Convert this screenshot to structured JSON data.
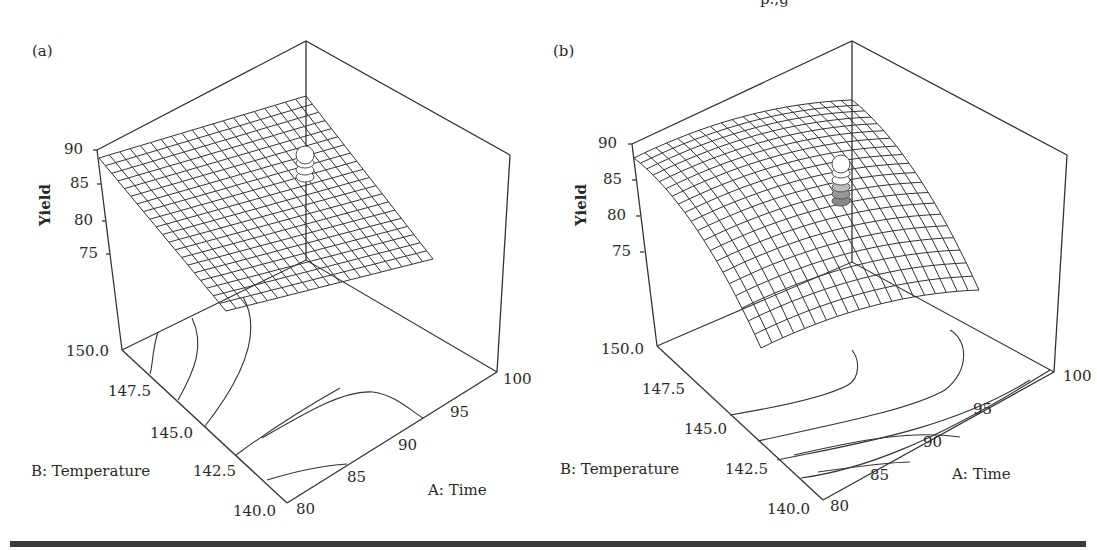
{
  "figure": {
    "clipped_top_text": "p.,g",
    "panels": [
      {
        "label": "(a)",
        "z_axis": {
          "title": "Yield",
          "ticks": [
            "90",
            "85",
            "80",
            "75"
          ]
        },
        "b_axis": {
          "title": "B: Temperature",
          "ticks": [
            "150.0",
            "147.5",
            "145.0",
            "142.5",
            "140.0"
          ]
        },
        "a_axis": {
          "title": "A: Time",
          "ticks": [
            "80",
            "85",
            "90",
            "95",
            "100"
          ]
        }
      },
      {
        "label": "(b)",
        "z_axis": {
          "title": "Yield",
          "ticks": [
            "90",
            "85",
            "80",
            "75"
          ]
        },
        "b_axis": {
          "title": "B: Temperature",
          "ticks": [
            "150.0",
            "147.5",
            "145.0",
            "142.5",
            "140.0"
          ]
        },
        "a_axis": {
          "title": "A: Time",
          "ticks": [
            "80",
            "85",
            "90",
            "95",
            "100"
          ]
        }
      }
    ]
  },
  "chart_data": [
    {
      "type": "surface",
      "title": "(a)",
      "xlabel": "A: Time",
      "ylabel": "B: Temperature",
      "zlabel": "Yield",
      "x_ticks": [
        80,
        85,
        90,
        95,
        100
      ],
      "y_ticks": [
        140.0,
        142.5,
        145.0,
        147.5,
        150.0
      ],
      "z_ticks": [
        75,
        80,
        85,
        90
      ],
      "xlim": [
        80,
        100
      ],
      "ylim": [
        140,
        150
      ],
      "zlim": [
        70,
        90
      ],
      "surface_shape": "near-planar (linear/interaction model), highest ~88 at A=80/B=150 corner, lowest at A=100/B=140 corner",
      "grid": "mesh 20x20",
      "design_points": "center point replicates shown as stacked spheres near Yield ~84",
      "contour_projection": true
    },
    {
      "type": "surface",
      "title": "(b)",
      "xlabel": "A: Time",
      "ylabel": "B: Temperature",
      "zlabel": "Yield",
      "x_ticks": [
        80,
        85,
        90,
        95,
        100
      ],
      "y_ticks": [
        140.0,
        142.5,
        145.0,
        147.5,
        150.0
      ],
      "z_ticks": [
        75,
        80,
        85,
        90
      ],
      "xlim": [
        80,
        100
      ],
      "ylim": [
        140,
        150
      ],
      "zlim": [
        70,
        90
      ],
      "surface_shape": "curved dome (quadratic model), maximum ~88-89 near center, falling toward edges",
      "grid": "mesh 20x20",
      "design_points": "center point replicates shown as stacked spheres (some above, some below surface) near Yield ~80-85",
      "contour_projection": true
    }
  ]
}
